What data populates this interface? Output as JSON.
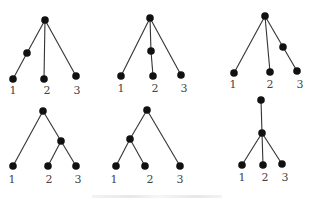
{
  "figure": {
    "trees": [
      {
        "name": "tree-1",
        "nodes": [
          {
            "id": "r",
            "x": 45,
            "y": 20
          },
          {
            "id": "a",
            "x": 27,
            "y": 53
          },
          {
            "id": "l1",
            "x": 13,
            "y": 79
          },
          {
            "id": "l2",
            "x": 44,
            "y": 79
          },
          {
            "id": "l3",
            "x": 76,
            "y": 76
          }
        ],
        "edges": [
          [
            "r",
            "a"
          ],
          [
            "a",
            "l1"
          ],
          [
            "r",
            "l2"
          ],
          [
            "r",
            "l3"
          ]
        ],
        "labels": [
          {
            "text": "1",
            "x": 13,
            "y": 94
          },
          {
            "text": "2",
            "x": 47,
            "y": 94
          },
          {
            "text": "3",
            "x": 77,
            "y": 94
          }
        ]
      },
      {
        "name": "tree-2",
        "nodes": [
          {
            "id": "r",
            "x": 150,
            "y": 18
          },
          {
            "id": "a",
            "x": 151,
            "y": 51
          },
          {
            "id": "l1",
            "x": 121,
            "y": 76
          },
          {
            "id": "l2",
            "x": 153,
            "y": 76
          },
          {
            "id": "l3",
            "x": 181,
            "y": 75
          }
        ],
        "edges": [
          [
            "r",
            "l1"
          ],
          [
            "r",
            "a"
          ],
          [
            "a",
            "l2"
          ],
          [
            "r",
            "l3"
          ]
        ],
        "labels": [
          {
            "text": "1",
            "x": 121,
            "y": 92
          },
          {
            "text": "2",
            "x": 155,
            "y": 92
          },
          {
            "text": "3",
            "x": 184,
            "y": 92
          }
        ]
      },
      {
        "name": "tree-3",
        "nodes": [
          {
            "id": "r",
            "x": 265,
            "y": 16
          },
          {
            "id": "a",
            "x": 283,
            "y": 47
          },
          {
            "id": "l1",
            "x": 234,
            "y": 73
          },
          {
            "id": "l2",
            "x": 270,
            "y": 72
          },
          {
            "id": "l3",
            "x": 297,
            "y": 71
          }
        ],
        "edges": [
          [
            "r",
            "l1"
          ],
          [
            "r",
            "l2"
          ],
          [
            "r",
            "a"
          ],
          [
            "a",
            "l3"
          ]
        ],
        "labels": [
          {
            "text": "1",
            "x": 233,
            "y": 88
          },
          {
            "text": "2",
            "x": 270,
            "y": 88
          },
          {
            "text": "3",
            "x": 300,
            "y": 88
          }
        ]
      },
      {
        "name": "tree-4",
        "nodes": [
          {
            "id": "r",
            "x": 43,
            "y": 111
          },
          {
            "id": "a",
            "x": 61,
            "y": 141
          },
          {
            "id": "l1",
            "x": 13,
            "y": 166
          },
          {
            "id": "l2",
            "x": 48,
            "y": 166
          },
          {
            "id": "l3",
            "x": 76,
            "y": 166
          }
        ],
        "edges": [
          [
            "r",
            "l1"
          ],
          [
            "r",
            "a"
          ],
          [
            "a",
            "l2"
          ],
          [
            "a",
            "l3"
          ]
        ],
        "labels": [
          {
            "text": "1",
            "x": 12,
            "y": 183
          },
          {
            "text": "2",
            "x": 49,
            "y": 183
          },
          {
            "text": "3",
            "x": 78,
            "y": 183
          }
        ]
      },
      {
        "name": "tree-5",
        "nodes": [
          {
            "id": "r",
            "x": 147,
            "y": 110
          },
          {
            "id": "a",
            "x": 130,
            "y": 139
          },
          {
            "id": "l1",
            "x": 116,
            "y": 166
          },
          {
            "id": "l2",
            "x": 145,
            "y": 166
          },
          {
            "id": "l3",
            "x": 180,
            "y": 166
          }
        ],
        "edges": [
          [
            "r",
            "a"
          ],
          [
            "a",
            "l1"
          ],
          [
            "a",
            "l2"
          ],
          [
            "r",
            "l3"
          ]
        ],
        "labels": [
          {
            "text": "1",
            "x": 114,
            "y": 183
          },
          {
            "text": "2",
            "x": 150,
            "y": 183
          },
          {
            "text": "3",
            "x": 180,
            "y": 183
          }
        ]
      },
      {
        "name": "tree-6",
        "nodes": [
          {
            "id": "r",
            "x": 261,
            "y": 100
          },
          {
            "id": "a",
            "x": 262,
            "y": 133
          },
          {
            "id": "l1",
            "x": 242,
            "y": 165
          },
          {
            "id": "l2",
            "x": 263,
            "y": 165
          },
          {
            "id": "l3",
            "x": 282,
            "y": 164
          }
        ],
        "edges": [
          [
            "r",
            "a"
          ],
          [
            "a",
            "l1"
          ],
          [
            "a",
            "l2"
          ],
          [
            "a",
            "l3"
          ]
        ],
        "labels": [
          {
            "text": "1",
            "x": 242,
            "y": 181
          },
          {
            "text": "2",
            "x": 265,
            "y": 181
          },
          {
            "text": "3",
            "x": 285,
            "y": 181
          }
        ]
      }
    ],
    "node_color": "#111111",
    "edge_color": "#333333"
  }
}
